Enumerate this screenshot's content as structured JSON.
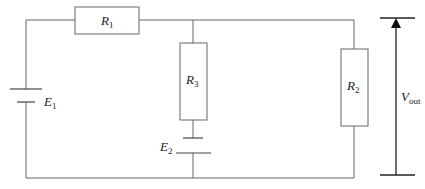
{
  "diagram": {
    "type": "circuit",
    "components": {
      "R1": {
        "symbol": "R",
        "subscript": "1",
        "kind": "resistor"
      },
      "R2": {
        "symbol": "R",
        "subscript": "2",
        "kind": "resistor"
      },
      "R3": {
        "symbol": "R",
        "subscript": "3",
        "kind": "resistor"
      },
      "E1": {
        "symbol": "E",
        "subscript": "1",
        "kind": "battery"
      },
      "E2": {
        "symbol": "E",
        "subscript": "2",
        "kind": "battery"
      }
    },
    "output": {
      "symbol": "V",
      "subscript": "out",
      "kind": "voltage-arrow"
    },
    "colors": {
      "wire": "#666666",
      "arrow": "#222222",
      "background": "#ffffff"
    }
  }
}
